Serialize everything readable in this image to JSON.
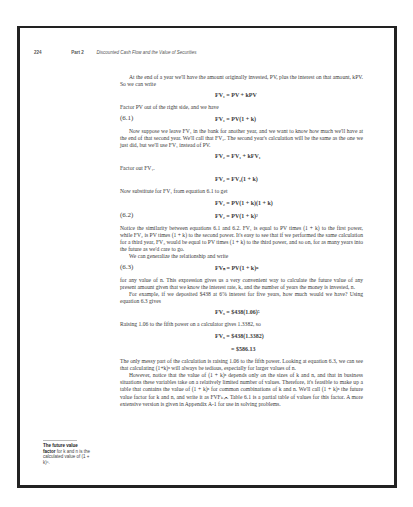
{
  "running_head": {
    "page_number": "224",
    "part": "Part 2",
    "title": "Discounted Cash Flow and the Value of Securities"
  },
  "body": [
    {
      "type": "p",
      "indent": true,
      "text": "At the end of a year we'll have the amount originally invested, PV, plus the interest on that amount, kPV. So we can write"
    },
    {
      "type": "eq",
      "num": "",
      "expr": "FV₁ = PV + kPV"
    },
    {
      "type": "p",
      "indent": false,
      "text": "Factor PV out of the right side, and we have"
    },
    {
      "type": "eq",
      "num": "(6.1)",
      "expr": "FV₁ = PV(1 + k)"
    },
    {
      "type": "p",
      "indent": true,
      "text": "Now suppose we leave FV₁ in the bank for another year, and we want to know how much we'll have at the end of that second year. We'll call that FV₂. The second year's calculation will be the same as the one we just did, but we'll use FV₁ instead of PV."
    },
    {
      "type": "eq",
      "num": "",
      "expr": "FV₂ = FV₁ + kFV₁"
    },
    {
      "type": "p",
      "indent": false,
      "text": "Factor out FV₁."
    },
    {
      "type": "eq",
      "num": "",
      "expr": "FV₂ = FV₁(1 + k)"
    },
    {
      "type": "p",
      "indent": false,
      "text": "Now substitute for FV₁ from equation 6.1 to get"
    },
    {
      "type": "eq",
      "num": "",
      "expr": "FV₂ = PV(1 + k)(1 + k)"
    },
    {
      "type": "eq",
      "num": "(6.2)",
      "expr": "FV₂ = PV(1 + k)²"
    },
    {
      "type": "p",
      "indent": false,
      "text": "Notice the similarity between equations 6.1 and 6.2. FV₁ is equal to PV times (1 + k) to the first power, while FV₂ is PV times (1 + k) to the second power. It's easy to see that if we performed the same calculation for a third year, FV₃ would be equal to PV times (1 + k) to the third power, and so on, for as many years into the future as we'd care to go."
    },
    {
      "type": "p",
      "indent": true,
      "text": "We can generalize the relationship and write"
    },
    {
      "type": "eq",
      "num": "(6.3)",
      "expr": "FVₙ = PV(1 + k)ⁿ"
    },
    {
      "type": "p",
      "indent": false,
      "text": "for any value of n. This expression gives us a very convenient way to calculate the future value of any present amount given that we know the interest rate, k, and the number of years the money is invested, n."
    },
    {
      "type": "p",
      "indent": true,
      "text": "For example, if we deposited $438 at 6% interest for five years, how much would we have? Using equation 6.3 gives"
    },
    {
      "type": "eq",
      "num": "",
      "expr": "FV₅ = $438(1.06)⁵"
    },
    {
      "type": "p",
      "indent": false,
      "text": "Raising 1.06 to the fifth power on a calculator gives 1.3382, so"
    },
    {
      "type": "eq",
      "num": "",
      "expr": "FV₅ = $438(1.3382)"
    },
    {
      "type": "eq",
      "num": "",
      "expr": "= $586.13",
      "cont": true
    },
    {
      "type": "p",
      "indent": false,
      "text": "The only messy part of the calculation is raising 1.06 to the fifth power. Looking at equation 6.3, we can see that calculating (1+k)ⁿ will always be tedious, especially for larger values of n."
    },
    {
      "type": "p",
      "indent": true,
      "text": "However, notice that the value of (1 + k)ⁿ depends only on the sizes of k and n, and that in business situations these variables take on a relatively limited number of values. Therefore, it's feasible to make up a table that contains the value of (1 + k)ⁿ for common combinations of k and n. We'll call (1 + k)ⁿ the future value factor for k and n, and write it as FVFₖ,ₙ. Table 6.1 is a partial table of values for this factor. A more extensive version is given in Appendix A-1 for use in solving problems."
    }
  ],
  "margin_note": {
    "bold": "The future value factor",
    "rest": " for k and n is the calculated value of (1 + k)ⁿ."
  }
}
